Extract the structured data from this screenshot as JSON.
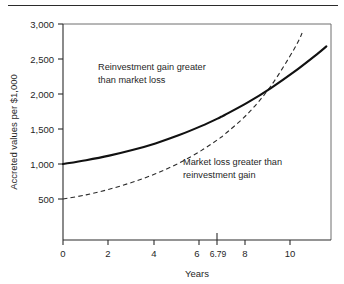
{
  "figure": {
    "top_rule": true,
    "background": "#ffffff",
    "ink_color": "#1a1a1a"
  },
  "chart_data": {
    "type": "line",
    "title": "",
    "subtitle": "",
    "xlabel": "Years",
    "ylabel": "Accreted values per $1,000",
    "xlim": [
      0,
      11.6
    ],
    "ylim": [
      -85,
      3000
    ],
    "grid": false,
    "legend": "none",
    "x_ticks": [
      0,
      2,
      4,
      6,
      6.79,
      8,
      10
    ],
    "x_tick_labels": [
      "0",
      "2",
      "4",
      "6",
      "6.79",
      "8",
      "10"
    ],
    "y_ticks": [
      500,
      1000,
      1500,
      2000,
      2500,
      3000
    ],
    "y_tick_labels": [
      "500",
      "1,000",
      "1,500",
      "2,000",
      "2,500",
      "3,000"
    ],
    "crossover": {
      "x": 6.79,
      "y": 1740,
      "label": "6.79"
    },
    "series": [
      {
        "name": "Reinvestment gain (accreted value)",
        "style": "solid",
        "color": "#111111",
        "x": [
          0,
          1,
          2,
          3,
          4,
          5,
          6,
          6.79,
          7,
          8,
          9,
          10,
          11,
          11.4
        ],
        "values": [
          1000,
          1055,
          1120,
          1200,
          1295,
          1410,
          1545,
          1665,
          1700,
          1880,
          2085,
          2315,
          2570,
          2680
        ]
      },
      {
        "name": "Market loss (present value)",
        "style": "dashed",
        "color": "#2b2b2b",
        "x": [
          0,
          1,
          2,
          3,
          4,
          5,
          6,
          6.79,
          7,
          8,
          9,
          10,
          10.35
        ],
        "values": [
          500,
          560,
          640,
          740,
          860,
          1010,
          1195,
          1370,
          1425,
          1720,
          2115,
          2640,
          2870
        ]
      }
    ],
    "annotations": [
      {
        "id": "upper-region-note",
        "lines": [
          "Reinvestment gain greater",
          "than market loss"
        ],
        "x": 2.0,
        "y": 2330
      },
      {
        "id": "lower-region-note",
        "lines": [
          "Market loss greater than",
          "reinvestment gain"
        ],
        "x": 6.4,
        "y": 930
      }
    ]
  }
}
